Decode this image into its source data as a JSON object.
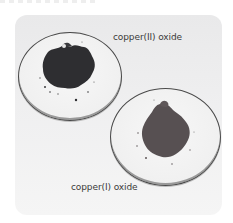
{
  "figure": {
    "background_color": "#ececed",
    "labels": {
      "top": "copper(II) oxide",
      "bottom": "copper(I) oxide"
    },
    "samples": [
      {
        "name": "copper(II) oxide",
        "powder_color": "#2e2e31",
        "dish_position": "upper-left"
      },
      {
        "name": "copper(I) oxide",
        "powder_color": "#575052",
        "dish_position": "lower-right"
      }
    ]
  }
}
